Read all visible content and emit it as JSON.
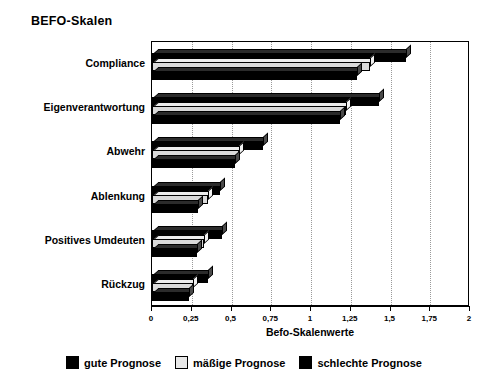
{
  "chart_data": {
    "type": "bar",
    "orientation": "horizontal",
    "title": "BEFO-Skalen",
    "xlabel": "Befo-Skalenwerte",
    "ylabel": "",
    "xlim": [
      0,
      2
    ],
    "grid": true,
    "grid_axis": "x",
    "legend_position": "bottom",
    "xticks": [
      "0",
      "0,25",
      "0,5",
      "0,75",
      "1",
      "1,25",
      "1,5",
      "1,75",
      "2"
    ],
    "xtick_values": [
      0,
      0.25,
      0.5,
      0.75,
      1,
      1.25,
      1.5,
      1.75,
      2
    ],
    "categories": [
      "Compliance",
      "Eigenverantwortung",
      "Abwehr",
      "Ablenkung",
      "Positives Umdeuten",
      "Rückzug"
    ],
    "series": [
      {
        "name": "gute Prognose",
        "color": "#000000",
        "style": "dark",
        "values": [
          1.29,
          1.18,
          0.52,
          0.29,
          0.28,
          0.23
        ]
      },
      {
        "name": "mäßige Prognose",
        "color": "#d9d9d9",
        "style": "light",
        "values": [
          1.37,
          1.22,
          0.55,
          0.35,
          0.33,
          0.26
        ]
      },
      {
        "name": "schlechte Prognose",
        "color": "#000000",
        "style": "dark",
        "values": [
          1.6,
          1.43,
          0.7,
          0.43,
          0.44,
          0.35
        ]
      }
    ]
  },
  "legend": {
    "items": [
      {
        "label": "gute Prognose",
        "style": "dark"
      },
      {
        "label": "mäßige Prognose",
        "style": "light"
      },
      {
        "label": "schlechte Prognose",
        "style": "dark"
      }
    ]
  }
}
